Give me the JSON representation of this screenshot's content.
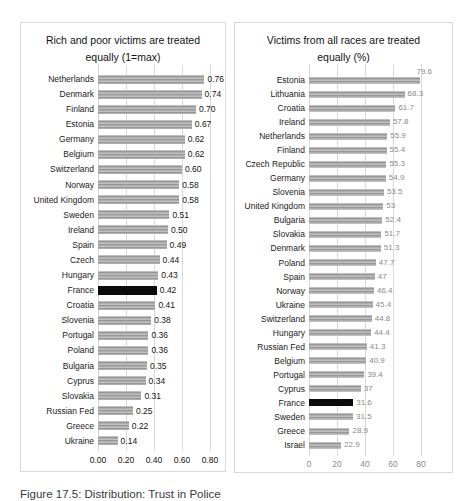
{
  "caption": "Figure 17.5: Distribution: Trust in Police",
  "colors": {
    "background": "#ffffff",
    "chart_border": "#d9d9d9",
    "gridline": "#d9d9d9",
    "bar": "#a6a6a6",
    "bar_highlight": "#0b0b0b",
    "left_text": "#141414",
    "right_value_text": "#8a8a8a"
  },
  "chart_data": [
    {
      "type": "bar",
      "orientation": "horizontal",
      "title": "Rich and poor victims are treated equally (1=max)",
      "title_lines": [
        "Rich and poor victims are treated",
        "equally (1=max)"
      ],
      "xlabel": "",
      "ylabel": "",
      "xlim": [
        0,
        0.8
      ],
      "xticks": [
        "0.00",
        "0.20",
        "0.40",
        "0.60",
        "0.80"
      ],
      "grid": true,
      "legend": false,
      "highlight_category": "France",
      "points": [
        {
          "country": "Netherlands",
          "value": 0.76,
          "label": "0.76"
        },
        {
          "country": "Denmark",
          "value": 0.74,
          "label": "0.74"
        },
        {
          "country": "Finland",
          "value": 0.7,
          "label": "0.70"
        },
        {
          "country": "Estonia",
          "value": 0.67,
          "label": "0.67"
        },
        {
          "country": "Germany",
          "value": 0.62,
          "label": "0.62"
        },
        {
          "country": "Belgium",
          "value": 0.62,
          "label": "0.62"
        },
        {
          "country": "Switzerland",
          "value": 0.6,
          "label": "0.60"
        },
        {
          "country": "Norway",
          "value": 0.58,
          "label": "0.58"
        },
        {
          "country": "United Kingdom",
          "value": 0.58,
          "label": "0.58"
        },
        {
          "country": "Sweden",
          "value": 0.51,
          "label": "0.51"
        },
        {
          "country": "Ireland",
          "value": 0.5,
          "label": "0.50"
        },
        {
          "country": "Spain",
          "value": 0.49,
          "label": "0.49"
        },
        {
          "country": "Czech",
          "value": 0.44,
          "label": "0.44"
        },
        {
          "country": "Hungary",
          "value": 0.43,
          "label": "0.43"
        },
        {
          "country": "France",
          "value": 0.42,
          "label": "0.42",
          "highlight": true
        },
        {
          "country": "Croatia",
          "value": 0.41,
          "label": "0.41"
        },
        {
          "country": "Slovenia",
          "value": 0.38,
          "label": "0.38"
        },
        {
          "country": "Portugal",
          "value": 0.36,
          "label": "0.36"
        },
        {
          "country": "Poland",
          "value": 0.36,
          "label": "0.36"
        },
        {
          "country": "Bulgaria",
          "value": 0.35,
          "label": "0.35"
        },
        {
          "country": "Cyprus",
          "value": 0.34,
          "label": "0.34"
        },
        {
          "country": "Slovakia",
          "value": 0.31,
          "label": "0.31"
        },
        {
          "country": "Russian Fed",
          "value": 0.25,
          "label": "0.25"
        },
        {
          "country": "Greece",
          "value": 0.22,
          "label": "0.22"
        },
        {
          "country": "Ukraine",
          "value": 0.14,
          "label": "0.14"
        }
      ]
    },
    {
      "type": "bar",
      "orientation": "horizontal",
      "title": "Victims from all races are treated equally (%)",
      "title_lines": [
        "Victims from all races are treated",
        "equally (%)"
      ],
      "xlabel": "",
      "ylabel": "",
      "xlim": [
        0,
        80
      ],
      "xticks": [
        "0",
        "20",
        "40",
        "60",
        "80"
      ],
      "grid": true,
      "legend": false,
      "highlight_category": "France",
      "points": [
        {
          "country": "Estonia",
          "value": 79.6,
          "label": "79.6",
          "label_above": true
        },
        {
          "country": "Lithuania",
          "value": 68.3,
          "label": "68.3"
        },
        {
          "country": "Croatia",
          "value": 61.7,
          "label": "61.7"
        },
        {
          "country": "Ireland",
          "value": 57.8,
          "label": "57.8"
        },
        {
          "country": "Netherlands",
          "value": 55.9,
          "label": "55.9"
        },
        {
          "country": "Finland",
          "value": 55.4,
          "label": "55.4"
        },
        {
          "country": "Czech Republic",
          "value": 55.3,
          "label": "55.3"
        },
        {
          "country": "Germany",
          "value": 54.9,
          "label": "54.9"
        },
        {
          "country": "Slovenia",
          "value": 53.5,
          "label": "53.5"
        },
        {
          "country": "United Kingdom",
          "value": 53,
          "label": "53"
        },
        {
          "country": "Bulgaria",
          "value": 52.4,
          "label": "52.4"
        },
        {
          "country": "Slovakia",
          "value": 51.7,
          "label": "51.7"
        },
        {
          "country": "Denmark",
          "value": 51.3,
          "label": "51.3"
        },
        {
          "country": "Poland",
          "value": 47.7,
          "label": "47.7"
        },
        {
          "country": "Spain",
          "value": 47,
          "label": "47"
        },
        {
          "country": "Norway",
          "value": 46.4,
          "label": "46.4"
        },
        {
          "country": "Ukraine",
          "value": 45.4,
          "label": "45.4"
        },
        {
          "country": "Switzerland",
          "value": 44.8,
          "label": "44.8"
        },
        {
          "country": "Hungary",
          "value": 44.4,
          "label": "44.4"
        },
        {
          "country": "Russian Fed",
          "value": 41.3,
          "label": "41.3"
        },
        {
          "country": "Belgium",
          "value": 40.9,
          "label": "40.9"
        },
        {
          "country": "Portugal",
          "value": 39.4,
          "label": "39.4"
        },
        {
          "country": "Cyprus",
          "value": 37,
          "label": "37"
        },
        {
          "country": "France",
          "value": 31.6,
          "label": "31.6",
          "highlight": true
        },
        {
          "country": "Sweden",
          "value": 31.5,
          "label": "31.5"
        },
        {
          "country": "Greece",
          "value": 28.9,
          "label": "28.9"
        },
        {
          "country": "Israel",
          "value": 22.9,
          "label": "22.9"
        }
      ]
    }
  ]
}
